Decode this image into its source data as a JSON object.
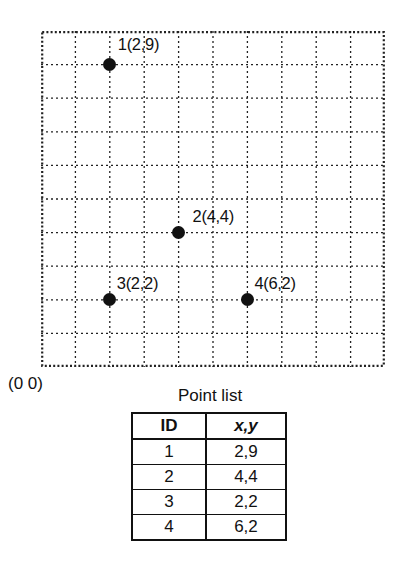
{
  "plot": {
    "grid": {
      "columns": 10,
      "rows": 10,
      "x_min": 0,
      "x_max": 10,
      "y_min": 0,
      "y_max": 10,
      "line_style": "dotted",
      "border_style": "dotted",
      "line_color": "#222222"
    },
    "origin_label": "(0 0)",
    "points": [
      {
        "id": "1",
        "label": "1(2,9)",
        "x": 2,
        "y": 9
      },
      {
        "id": "2",
        "label": "2(4,4)",
        "x": 4,
        "y": 4
      },
      {
        "id": "3",
        "label": "3(2,2)",
        "x": 2,
        "y": 2
      },
      {
        "id": "4",
        "label": "4(6,2)",
        "x": 6,
        "y": 2
      }
    ]
  },
  "table": {
    "caption": "Point list",
    "headers": [
      "ID",
      "x,y"
    ],
    "rows": [
      {
        "id": "1",
        "xy": "2,9"
      },
      {
        "id": "2",
        "xy": "4,4"
      },
      {
        "id": "3",
        "xy": "2,2"
      },
      {
        "id": "4",
        "xy": "6,2"
      }
    ]
  },
  "chart_data": {
    "type": "scatter",
    "title": "Point list",
    "xlabel": "",
    "ylabel": "",
    "xlim": [
      0,
      10
    ],
    "ylim": [
      0,
      10
    ],
    "grid": true,
    "legend": "none",
    "categories": [
      "1",
      "2",
      "3",
      "4"
    ],
    "x": [
      2,
      4,
      2,
      6
    ],
    "y": [
      9,
      4,
      2,
      2
    ],
    "labels": [
      "1(2,9)",
      "2(4,4)",
      "3(2,2)",
      "4(6,2)"
    ],
    "annotations": [
      "(0 0)"
    ]
  }
}
